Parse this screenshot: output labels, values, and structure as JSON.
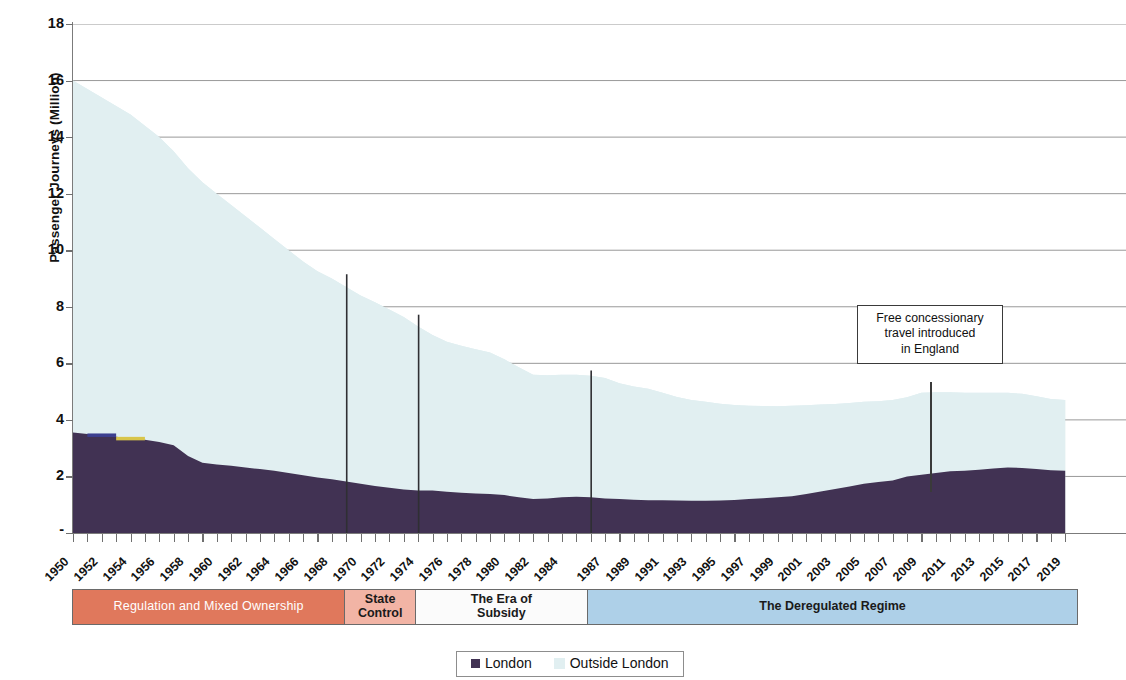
{
  "chart_data": {
    "type": "area",
    "title": "",
    "xlabel": "",
    "ylabel": "Passenger Journeys (Million)",
    "stacked": true,
    "ylim": [
      0,
      18
    ],
    "y_ticks": [
      "-",
      "2",
      "4",
      "6",
      "8",
      "10",
      "12",
      "14",
      "16",
      "18"
    ],
    "y_tick_values": [
      0,
      2,
      4,
      6,
      8,
      10,
      12,
      14,
      16,
      18
    ],
    "grid": "horizontal",
    "legend_position": "bottom",
    "x": [
      1950,
      1951,
      1952,
      1953,
      1954,
      1955,
      1956,
      1957,
      1958,
      1959,
      1960,
      1961,
      1962,
      1963,
      1964,
      1965,
      1966,
      1967,
      1968,
      1969,
      1970,
      1971,
      1972,
      1973,
      1974,
      1975,
      1976,
      1977,
      1978,
      1979,
      1980,
      1981,
      1982,
      1983,
      1984,
      1985,
      1986,
      1987,
      1988,
      1989,
      1990,
      1991,
      1992,
      1993,
      1994,
      1995,
      1996,
      1997,
      1998,
      1999,
      2000,
      2001,
      2002,
      2003,
      2004,
      2005,
      2006,
      2007,
      2008,
      2009,
      2010,
      2011,
      2012,
      2013,
      2014,
      2015,
      2016,
      2017,
      2018,
      2019
    ],
    "x_tick_labels": [
      "1950",
      "1952",
      "1954",
      "1956",
      "1958",
      "1960",
      "1962",
      "1964",
      "1966",
      "1968",
      "1970",
      "1972",
      "1974",
      "1976",
      "1978",
      "1980",
      "1982",
      "1984",
      "1987",
      "1989",
      "1991",
      "1993",
      "1995",
      "1997",
      "1999",
      "2001",
      "2003",
      "2005",
      "2007",
      "2009",
      "2011",
      "2013",
      "2015",
      "2017",
      "2019"
    ],
    "series": [
      {
        "name": "London",
        "color": "#413253",
        "values": [
          3.55,
          3.5,
          3.45,
          3.4,
          3.35,
          3.3,
          3.22,
          3.1,
          2.72,
          2.48,
          2.42,
          2.38,
          2.32,
          2.26,
          2.2,
          2.12,
          2.04,
          1.96,
          1.9,
          1.82,
          1.74,
          1.66,
          1.6,
          1.54,
          1.5,
          1.5,
          1.46,
          1.42,
          1.4,
          1.38,
          1.34,
          1.26,
          1.2,
          1.22,
          1.26,
          1.28,
          1.26,
          1.22,
          1.2,
          1.18,
          1.16,
          1.16,
          1.15,
          1.14,
          1.14,
          1.15,
          1.17,
          1.2,
          1.23,
          1.26,
          1.3,
          1.38,
          1.47,
          1.56,
          1.64,
          1.74,
          1.8,
          1.86,
          2.0,
          2.06,
          2.12,
          2.18,
          2.2,
          2.24,
          2.28,
          2.32,
          2.3,
          2.26,
          2.22,
          2.2
        ]
      },
      {
        "name": "Outside London",
        "color": "#e1eff1",
        "values": [
          12.45,
          12.2,
          11.95,
          11.7,
          11.45,
          11.1,
          10.78,
          10.4,
          10.18,
          9.92,
          9.58,
          9.22,
          8.88,
          8.54,
          8.2,
          7.88,
          7.56,
          7.3,
          7.1,
          6.88,
          6.66,
          6.5,
          6.3,
          6.1,
          5.8,
          5.5,
          5.3,
          5.2,
          5.1,
          5.0,
          4.8,
          4.6,
          4.4,
          4.36,
          4.34,
          4.32,
          4.3,
          4.26,
          4.1,
          4.0,
          3.94,
          3.8,
          3.66,
          3.56,
          3.5,
          3.42,
          3.36,
          3.3,
          3.26,
          3.22,
          3.2,
          3.14,
          3.07,
          3.0,
          2.96,
          2.9,
          2.86,
          2.84,
          2.8,
          2.9,
          2.86,
          2.8,
          2.76,
          2.72,
          2.68,
          2.64,
          2.62,
          2.58,
          2.52,
          2.5
        ]
      }
    ],
    "totals": [
      16.0,
      15.7,
      15.4,
      15.1,
      14.8,
      14.4,
      14.0,
      13.5,
      12.9,
      12.4,
      12.0,
      11.6,
      11.2,
      10.8,
      10.4,
      10.0,
      9.6,
      9.26,
      9.0,
      8.7,
      8.4,
      8.16,
      7.9,
      7.64,
      7.3,
      7.0,
      6.76,
      6.62,
      6.5,
      6.38,
      6.14,
      5.86,
      5.6,
      5.58,
      5.6,
      5.6,
      5.56,
      5.48,
      5.3,
      5.18,
      5.1,
      4.96,
      4.81,
      4.7,
      4.64,
      4.57,
      4.53,
      4.5,
      4.49,
      4.48,
      4.5,
      4.52,
      4.54,
      4.56,
      4.6,
      4.64,
      4.66,
      4.7,
      4.8,
      4.96,
      4.98,
      4.98,
      4.96,
      4.96,
      4.96,
      4.96,
      4.92,
      4.84,
      4.74,
      4.7
    ],
    "legend": [
      {
        "label": "London",
        "color": "#413253"
      },
      {
        "label": "Outside London",
        "color": "#e1eff1"
      }
    ],
    "markers": [
      {
        "year": 1969,
        "value": 9.15,
        "label": ""
      },
      {
        "year": 1974,
        "value": 7.72,
        "label": ""
      },
      {
        "year": 1986,
        "value": 5.75,
        "label": ""
      }
    ],
    "annotations": [
      {
        "text": "Free concessionary travel introduced in England",
        "lines": [
          "Free concessionary",
          "travel introduced",
          "in England"
        ],
        "year": 2007
      }
    ],
    "eras": [
      {
        "label": "Regulation and Mixed Ownership",
        "lines": [
          "Regulation and Mixed Ownership"
        ],
        "start": 1950,
        "end": 1969,
        "color": "#e0785c",
        "text_color": "#ffffff"
      },
      {
        "label": "State Control",
        "lines": [
          "State",
          "Control"
        ],
        "start": 1969,
        "end": 1974,
        "color": "#f2b4a5",
        "text_color": "#1a1a1a"
      },
      {
        "label": "The Era of Subsidy",
        "lines": [
          "The Era of",
          "Subsidy"
        ],
        "start": 1974,
        "end": 1986,
        "color": "#fbfbfb",
        "text_color": "#1a1a1a"
      },
      {
        "label": "The Deregulated Regime",
        "lines": [
          "The Deregulated Regime"
        ],
        "start": 1986,
        "end": 2019,
        "color": "#aed0e8",
        "text_color": "#1a1a1a"
      }
    ]
  }
}
